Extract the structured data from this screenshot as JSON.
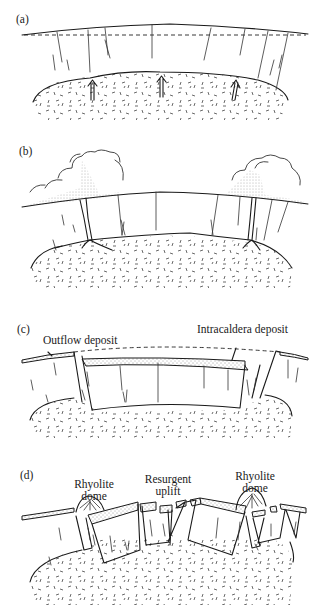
{
  "figure": {
    "panels": [
      {
        "id": "a",
        "label": "(a)"
      },
      {
        "id": "b",
        "label": "(b)"
      },
      {
        "id": "c",
        "label": "(c)",
        "annotations": {
          "outflow": "Outflow deposit",
          "intracaldera": "Intracaldera deposit"
        }
      },
      {
        "id": "d",
        "label": "(d)",
        "annotations": {
          "dome_left_1": "Rhyolite",
          "dome_left_2": "dome",
          "uplift_1": "Resurgent",
          "uplift_2": "uplift",
          "dome_right_1": "Rhyolite",
          "dome_right_2": "dome"
        }
      }
    ],
    "colors": {
      "ink": "#1a1a1a",
      "background": "#ffffff"
    }
  }
}
